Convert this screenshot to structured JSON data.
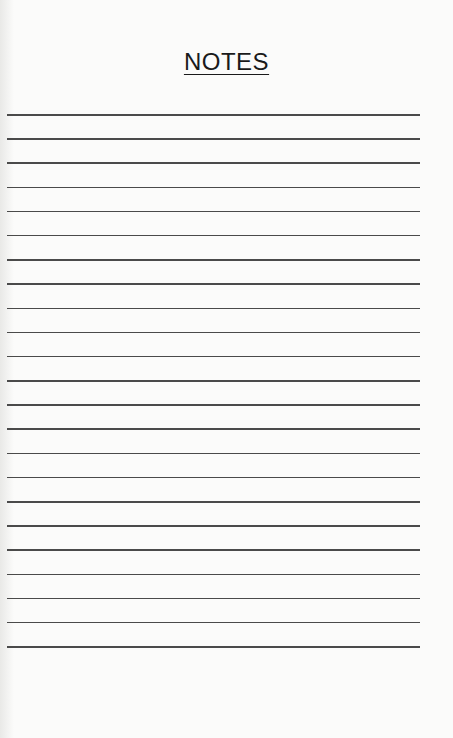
{
  "page": {
    "title": "NOTES",
    "line_count": 23,
    "line_color": "#4a4a4a",
    "background": "#fbfbfa"
  }
}
